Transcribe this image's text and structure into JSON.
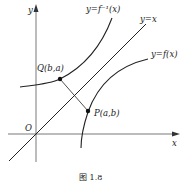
{
  "figure": {
    "caption": "图 1.8",
    "axes": {
      "x_label": "x",
      "y_label": "y",
      "origin_label": "O"
    },
    "curves": [
      {
        "name": "inverse-function",
        "label": "y=f⁻¹(x)"
      },
      {
        "name": "identity-line",
        "label": "y=x"
      },
      {
        "name": "function",
        "label": "y=f(x)"
      }
    ],
    "points": [
      {
        "name": "Q",
        "label": "Q(b,a)"
      },
      {
        "name": "P",
        "label": "P(a,b)"
      }
    ],
    "colors": {
      "stroke": "#222222",
      "background": "#ffffff"
    }
  }
}
